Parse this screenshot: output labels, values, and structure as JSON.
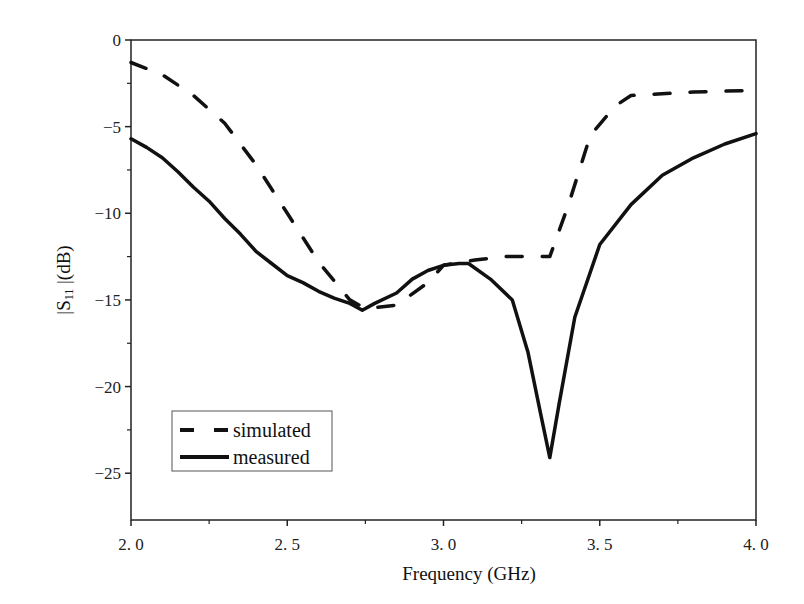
{
  "chart_data": {
    "type": "line",
    "title": "",
    "xlabel": "Frequency (GHz)",
    "ylabel": "|S11| (dB)",
    "ylabel_main": "|S",
    "ylabel_sub": "11",
    "ylabel_tail": " |(dB)",
    "xlim": [
      2.0,
      4.0
    ],
    "ylim": [
      -27.7,
      0
    ],
    "xticks": [
      2.0,
      2.5,
      3.0,
      3.5,
      4.0
    ],
    "xtick_labels": [
      "2. 0",
      "2. 5",
      "3. 0",
      "3. 5",
      "4. 0"
    ],
    "xminor": [
      2.25,
      2.75,
      3.25,
      3.75
    ],
    "yticks": [
      0,
      -5,
      -10,
      -15,
      -20,
      -25
    ],
    "ytick_labels": [
      "0",
      "-5",
      "-10",
      "-15",
      "-20",
      "-25"
    ],
    "yminor": [
      -2.5,
      -7.5,
      -12.5,
      -17.5,
      -22.5
    ],
    "grid": false,
    "legend_position": "lower left",
    "series": [
      {
        "name": "simulated",
        "style": "dashed",
        "color": "#111111",
        "x": [
          2.0,
          2.1,
          2.2,
          2.3,
          2.4,
          2.5,
          2.6,
          2.7,
          2.75,
          2.85,
          2.95,
          3.0,
          3.1,
          3.2,
          3.34,
          3.4,
          3.47,
          3.55,
          3.6,
          3.8,
          4.0
        ],
        "y": [
          -1.3,
          -2.0,
          -3.2,
          -4.8,
          -7.2,
          -10.0,
          -12.8,
          -15.0,
          -15.5,
          -15.3,
          -14.0,
          -13.0,
          -12.7,
          -12.5,
          -12.5,
          -9.5,
          -5.5,
          -3.8,
          -3.2,
          -3.0,
          -2.9
        ]
      },
      {
        "name": "measured",
        "style": "solid",
        "color": "#111111",
        "x": [
          2.0,
          2.05,
          2.1,
          2.15,
          2.2,
          2.25,
          2.3,
          2.35,
          2.4,
          2.45,
          2.5,
          2.55,
          2.6,
          2.65,
          2.7,
          2.74,
          2.78,
          2.85,
          2.9,
          2.95,
          3.0,
          3.05,
          3.08,
          3.15,
          3.22,
          3.27,
          3.31,
          3.34,
          3.37,
          3.42,
          3.5,
          3.6,
          3.7,
          3.8,
          3.9,
          4.0
        ],
        "y": [
          -5.7,
          -6.2,
          -6.8,
          -7.6,
          -8.5,
          -9.3,
          -10.3,
          -11.2,
          -12.2,
          -12.9,
          -13.6,
          -14.0,
          -14.5,
          -14.9,
          -15.2,
          -15.6,
          -15.2,
          -14.6,
          -13.8,
          -13.3,
          -13.0,
          -12.9,
          -12.9,
          -13.8,
          -15.0,
          -18.0,
          -21.5,
          -24.1,
          -21.0,
          -16.0,
          -11.8,
          -9.5,
          -7.8,
          -6.8,
          -6.0,
          -5.4
        ]
      }
    ]
  },
  "legend": {
    "items": [
      {
        "label": "simulated",
        "style": "dashed"
      },
      {
        "label": "measured",
        "style": "solid"
      }
    ]
  }
}
